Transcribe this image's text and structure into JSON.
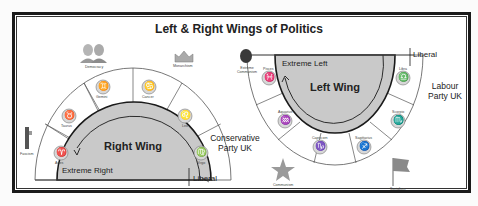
{
  "title": "Left & Right Wings of Politics",
  "right_wing_diagram": {
    "label": "Right Wing",
    "extreme_label": "Extreme Right",
    "liberal_label": "Liberal",
    "party_label_line1": "Conservative",
    "party_label_line2": "Party UK",
    "signs": [
      {
        "name": "Aries",
        "glyph": "♈"
      },
      {
        "name": "Taurus",
        "glyph": "♉"
      },
      {
        "name": "Gemini",
        "glyph": "♊"
      },
      {
        "name": "Cancer",
        "glyph": "♋"
      },
      {
        "name": "Leo",
        "glyph": "♌"
      },
      {
        "name": "Virgo",
        "glyph": "♍"
      }
    ],
    "ideologies": [
      {
        "name": "Fascism"
      },
      {
        "name": "Democracy"
      },
      {
        "name": "Monarchism"
      }
    ]
  },
  "left_wing_diagram": {
    "label": "Left Wing",
    "extreme_label": "Extreme Left",
    "liberal_label": "Liberal",
    "party_label_line1": "Labour",
    "party_label_line2": "Party UK",
    "signs": [
      {
        "name": "Pisces",
        "glyph": "♓"
      },
      {
        "name": "Aquarius",
        "glyph": "♒"
      },
      {
        "name": "Capricorn",
        "glyph": "♑"
      },
      {
        "name": "Sagittarius",
        "glyph": "♐"
      },
      {
        "name": "Scorpio",
        "glyph": "♏"
      },
      {
        "name": "Libra",
        "glyph": "♎"
      }
    ],
    "ideologies": [
      {
        "name": "Extreme Communism"
      },
      {
        "name": "Communism"
      },
      {
        "name": "Socialism"
      }
    ]
  },
  "colors": {
    "wing_fill": "#c9c9c9",
    "ring_fill": "#ffffff",
    "line": "#1a1a1a",
    "communism_star": "#9a9a9a",
    "socialism_flag": "#8a8a8a"
  }
}
